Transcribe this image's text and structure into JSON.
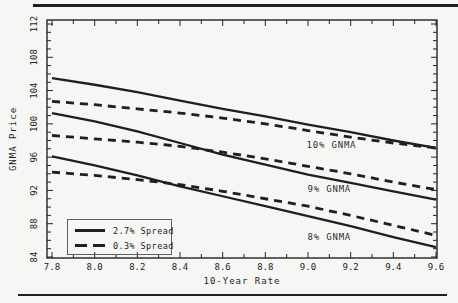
{
  "colors": {
    "ink": "#242424",
    "line": "#1f1f1f",
    "paper": "#f6f6f4"
  },
  "chart_data": {
    "type": "line",
    "title": "",
    "xlabel": "10-Year Rate",
    "ylabel": "GNMA Price",
    "xlim": [
      7.8,
      9.6
    ],
    "ylim": [
      84,
      112
    ],
    "x_minor_step": 0.1,
    "y_minor_step": 1,
    "grid": false,
    "xticks": [
      7.8,
      8.0,
      8.2,
      8.4,
      8.6,
      8.8,
      9.0,
      9.2,
      9.4,
      9.6
    ],
    "xtick_labels": [
      "7.8",
      "8.0",
      "8.2",
      "8.4",
      "8.6",
      "8.8",
      "9.0",
      "9.2",
      "9.4",
      "9.6"
    ],
    "yticks": [
      84,
      88,
      92,
      96,
      100,
      104,
      108,
      112
    ],
    "ytick_labels": [
      "84",
      "88",
      "92",
      "96",
      "100",
      "104",
      "108",
      "112"
    ],
    "x": [
      7.8,
      8.0,
      8.2,
      8.4,
      8.6,
      8.8,
      9.0,
      9.2,
      9.4,
      9.6
    ],
    "series": [
      {
        "name": "10% GNMA (2.7% Spread)",
        "group": "10% GNMA",
        "style": "solid",
        "values": [
          105.5,
          104.7,
          103.8,
          102.8,
          101.8,
          100.9,
          99.9,
          99.0,
          98.0,
          97.1
        ]
      },
      {
        "name": "10% GNMA (0.3% Spread)",
        "group": "10% GNMA",
        "style": "dashed",
        "values": [
          102.7,
          102.3,
          101.8,
          101.3,
          100.7,
          100.0,
          99.2,
          98.4,
          97.7,
          97.1
        ]
      },
      {
        "name": "9% GNMA (2.7% Spread)",
        "group": "9% GNMA",
        "style": "solid",
        "values": [
          101.3,
          100.3,
          99.1,
          97.7,
          96.3,
          95.1,
          93.9,
          92.9,
          91.9,
          90.9
        ]
      },
      {
        "name": "9% GNMA (0.3% Spread)",
        "group": "9% GNMA",
        "style": "dashed",
        "values": [
          98.6,
          98.2,
          97.8,
          97.3,
          96.6,
          95.8,
          94.9,
          94.0,
          93.0,
          92.1
        ]
      },
      {
        "name": "8% GNMA (2.7% Spread)",
        "group": "8% GNMA",
        "style": "solid",
        "values": [
          96.1,
          95.0,
          93.8,
          92.5,
          91.3,
          90.1,
          88.9,
          87.7,
          86.4,
          85.2
        ]
      },
      {
        "name": "8% GNMA (0.3% Spread)",
        "group": "8% GNMA",
        "style": "dashed",
        "values": [
          94.2,
          93.8,
          93.3,
          92.7,
          91.9,
          91.0,
          90.1,
          89.0,
          87.8,
          86.6
        ]
      }
    ],
    "legend": {
      "position": "lower-left",
      "entries": [
        {
          "label": "2.7% Spread",
          "style": "solid"
        },
        {
          "label": "0.3% Spread",
          "style": "dashed"
        }
      ]
    },
    "annotations": [
      {
        "text": "10% GNMA",
        "x": 9.11,
        "y": 97.4
      },
      {
        "text": "9% GNMA",
        "x": 9.1,
        "y": 92.2
      },
      {
        "text": "8% GNMA",
        "x": 9.1,
        "y": 86.4
      }
    ]
  }
}
